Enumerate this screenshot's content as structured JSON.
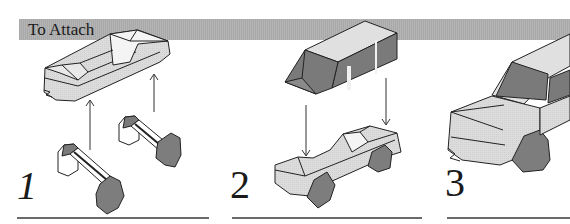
{
  "header": {
    "title": "To Attach"
  },
  "steps": [
    {
      "number": "1",
      "description": "Two wheel axles are pushed up into the car chassis"
    },
    {
      "number": "2",
      "description": "Cab body lowered onto the chassis with wheels"
    },
    {
      "number": "3",
      "description": "Assembled vehicle close-up"
    }
  ],
  "colors": {
    "header_bar": "#adadad",
    "body_light": "#d9d9d9",
    "body_dark": "#7a7a7a",
    "wheel": "#7d7d7d",
    "outline": "#222222",
    "rule": "#6a6a6a"
  }
}
